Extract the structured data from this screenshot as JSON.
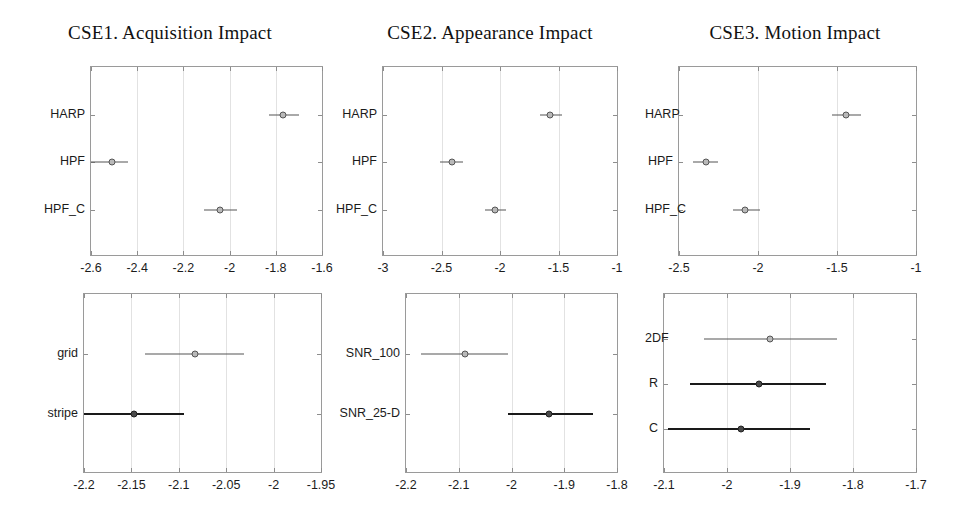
{
  "figure": {
    "width": 969,
    "height": 532,
    "background": "#ffffff",
    "marker_color": "#b9b9b9",
    "marker_edge_color": "#555555",
    "marker_color_dark": "#4a4a4a",
    "line_color": "#555555",
    "line_color_dark": "#1a1a1a",
    "axes_color": "#9a9a9a",
    "grid_color": "#e2e2e2"
  },
  "chart_data": [
    {
      "id": "cse1-acquisition-impact",
      "type": "scatter",
      "title": "CSE1. Acquisition Impact",
      "xlabel": "",
      "ylabel": "",
      "xlim": [
        -2.6,
        -1.6
      ],
      "xticks": [
        -2.6,
        -2.4,
        -2.2,
        -2.0,
        -1.8,
        -1.6
      ],
      "xticklabels": [
        "-2.6",
        "-2.4",
        "-2.2",
        "-2",
        "-1.8",
        "-1.6"
      ],
      "categories": [
        "HARP",
        "HPF",
        "HPF_C"
      ],
      "grid": true,
      "legend": "none",
      "points": [
        {
          "label": "HARP",
          "value": -1.77,
          "ci_low": -1.83,
          "ci_high": -1.7,
          "emphasis": false
        },
        {
          "label": "HPF",
          "value": -2.51,
          "ci_low": -2.6,
          "ci_high": -2.44,
          "emphasis": false
        },
        {
          "label": "HPF_C",
          "value": -2.04,
          "ci_low": -2.11,
          "ci_high": -1.97,
          "emphasis": false
        }
      ]
    },
    {
      "id": "cse2-appearance-impact",
      "type": "scatter",
      "title": "CSE2. Appearance Impact",
      "xlabel": "",
      "ylabel": "",
      "xlim": [
        -3.0,
        -1.0
      ],
      "xticks": [
        -3.0,
        -2.5,
        -2.0,
        -1.5,
        -1.0
      ],
      "xticklabels": [
        "-3",
        "-2.5",
        "-2",
        "-1.5",
        "-1"
      ],
      "categories": [
        "HARP",
        "HPF",
        "HPF_C"
      ],
      "grid": true,
      "legend": "none",
      "points": [
        {
          "label": "HARP",
          "value": -1.57,
          "ci_low": -1.66,
          "ci_high": -1.47,
          "emphasis": false
        },
        {
          "label": "HPF",
          "value": -2.41,
          "ci_low": -2.51,
          "ci_high": -2.32,
          "emphasis": false
        },
        {
          "label": "HPF_C",
          "value": -2.04,
          "ci_low": -2.13,
          "ci_high": -1.95,
          "emphasis": false
        }
      ]
    },
    {
      "id": "cse3-motion-impact",
      "type": "scatter",
      "title": "CSE3. Motion Impact",
      "xlabel": "",
      "ylabel": "",
      "xlim": [
        -2.5,
        -1.0
      ],
      "xticks": [
        -2.5,
        -2.0,
        -1.5,
        -1.0
      ],
      "xticklabels": [
        "-2.5",
        "-2",
        "-1.5",
        "-1"
      ],
      "categories": [
        "HARP",
        "HPF",
        "HPF_C"
      ],
      "grid": true,
      "legend": "none",
      "points": [
        {
          "label": "HARP",
          "value": -1.44,
          "ci_low": -1.53,
          "ci_high": -1.35,
          "emphasis": false
        },
        {
          "label": "HPF",
          "value": -2.33,
          "ci_low": -2.41,
          "ci_high": -2.25,
          "emphasis": false
        },
        {
          "label": "HPF_C",
          "value": -2.08,
          "ci_low": -2.16,
          "ci_high": -1.99,
          "emphasis": false
        }
      ]
    },
    {
      "id": "grid-stripe",
      "type": "scatter",
      "title": "",
      "xlabel": "",
      "ylabel": "",
      "xlim": [
        -2.2,
        -1.95
      ],
      "xticks": [
        -2.2,
        -2.15,
        -2.1,
        -2.05,
        -2.0,
        -1.95
      ],
      "xticklabels": [
        "-2.2",
        "-2.15",
        "-2.1",
        "-2.05",
        "-2",
        "-1.95"
      ],
      "categories": [
        "grid",
        "stripe"
      ],
      "grid": true,
      "legend": "none",
      "points": [
        {
          "label": "grid",
          "value": -2.083,
          "ci_low": -2.136,
          "ci_high": -2.031,
          "emphasis": false
        },
        {
          "label": "stripe",
          "value": -2.147,
          "ci_low": -2.2,
          "ci_high": -2.094,
          "emphasis": true
        }
      ]
    },
    {
      "id": "snr-comparison",
      "type": "scatter",
      "title": "",
      "xlabel": "",
      "ylabel": "",
      "xlim": [
        -2.2,
        -1.8
      ],
      "xticks": [
        -2.2,
        -2.1,
        -2.0,
        -1.9,
        -1.8
      ],
      "xticklabels": [
        "-2.2",
        "-2.1",
        "-2",
        "-1.9",
        "-1.8"
      ],
      "categories": [
        "SNR_100",
        "SNR_25-D"
      ],
      "grid": true,
      "legend": "none",
      "points": [
        {
          "label": "SNR_100",
          "value": -2.088,
          "ci_low": -2.172,
          "ci_high": -2.007,
          "emphasis": false
        },
        {
          "label": "SNR_25-D",
          "value": -1.928,
          "ci_low": -2.007,
          "ci_high": -1.846,
          "emphasis": true
        }
      ]
    },
    {
      "id": "model-comparison",
      "type": "scatter",
      "title": "",
      "xlabel": "",
      "ylabel": "",
      "xlim": [
        -2.1,
        -1.7
      ],
      "xticks": [
        -2.1,
        -2.0,
        -1.9,
        -1.8,
        -1.7
      ],
      "xticklabels": [
        "-2.1",
        "-2",
        "-1.9",
        "-1.8",
        "-1.7"
      ],
      "categories": [
        "2DF",
        "R",
        "C"
      ],
      "grid": true,
      "legend": "none",
      "points": [
        {
          "label": "2DF",
          "value": -1.931,
          "ci_low": -2.036,
          "ci_high": -1.826,
          "emphasis": false
        },
        {
          "label": "R",
          "value": -1.95,
          "ci_low": -2.058,
          "ci_high": -1.843,
          "emphasis": true
        },
        {
          "label": "C",
          "value": -1.977,
          "ci_low": -2.093,
          "ci_high": -1.868,
          "emphasis": true
        }
      ]
    }
  ]
}
